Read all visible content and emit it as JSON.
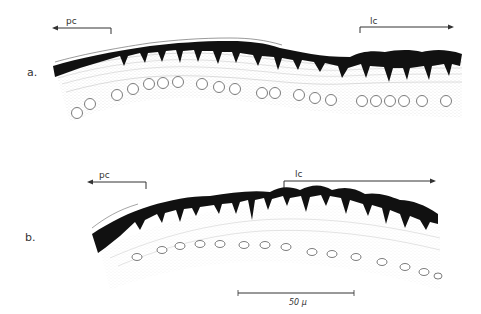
{
  "figure": {
    "type": "histological cross-section drawing",
    "panels": [
      {
        "id": "a",
        "label": "a.",
        "regions": [
          {
            "abbr": "pc",
            "arrow_direction": "left"
          },
          {
            "abbr": "lc",
            "arrow_direction": "right"
          }
        ]
      },
      {
        "id": "b",
        "label": "b.",
        "regions": [
          {
            "abbr": "pc",
            "arrow_direction": "left"
          },
          {
            "abbr": "lc",
            "arrow_direction": "right"
          }
        ]
      }
    ],
    "scale_bar": {
      "label": "50 μ"
    }
  },
  "colors": {
    "background": "#ffffff",
    "ink": "#111111",
    "stipple": "#9a9a9a",
    "text": "#333333"
  }
}
